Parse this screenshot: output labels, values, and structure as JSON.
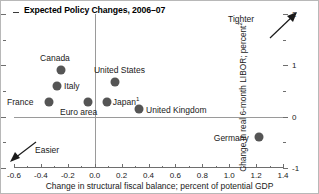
{
  "chart_data": {
    "type": "scatter",
    "title": "Expected Policy Changes, 2006–07",
    "xlabel": "Change in structural fiscal balance; percent of potential GDP",
    "ylabel": "Change in real 6-month LIBOR; percent",
    "ylabel_superscript": "2",
    "xlim": [
      -0.6,
      1.4
    ],
    "ylim": [
      -1,
      2
    ],
    "xticks": [
      -0.6,
      -0.4,
      -0.2,
      0.0,
      0.2,
      0.4,
      0.6,
      0.8,
      1.0,
      1.2,
      1.4
    ],
    "xtick_labels": [
      "-0.6",
      "-0.4",
      "-0.2",
      "0.0",
      "0.2",
      "0.4",
      "0.6",
      "0.8",
      "1.0",
      "1.2",
      "1.4"
    ],
    "yticks": [
      2,
      1,
      0,
      -1
    ],
    "ytick_labels": [
      "2",
      "1",
      "0",
      "-1"
    ],
    "yticks_minor": [
      1.5,
      0.5,
      -0.5
    ],
    "grid": false,
    "legend": "none",
    "zero_line_y": 0,
    "zero_line_x": 0.0,
    "points": [
      {
        "label": "Canada",
        "x": -0.25,
        "y": 0.9,
        "label_dx": -21,
        "label_dy": -17
      },
      {
        "label": "Italy",
        "x": -0.28,
        "y": 0.6,
        "label_dx": 7,
        "label_dy": -5
      },
      {
        "label": "France",
        "x": -0.34,
        "y": 0.29,
        "label_dx": -42,
        "label_dy": -5
      },
      {
        "label": "Euro area",
        "x": -0.05,
        "y": 0.29,
        "label_dx": -28,
        "label_dy": 5
      },
      {
        "label": "Japan",
        "x": 0.09,
        "y": 0.29,
        "label_dx": 6,
        "label_dy": -6,
        "footnote": "1"
      },
      {
        "label": "United States",
        "x": 0.15,
        "y": 0.67,
        "label_dx": -21,
        "label_dy": -17
      },
      {
        "label": "United Kingdom",
        "x": 0.33,
        "y": 0.14,
        "label_dx": 7,
        "label_dy": -4
      },
      {
        "label": "Germany",
        "x": 1.22,
        "y": -0.39,
        "label_dx": -45,
        "label_dy": -4
      }
    ],
    "annotations": [
      {
        "name": "tighter",
        "text": "Tighter",
        "direction": "up-right"
      },
      {
        "name": "easier",
        "text": "Easier",
        "direction": "down-left"
      }
    ],
    "colors": {
      "marker": "#555555",
      "axis": "#6e6e6e",
      "zero_line": "#9a9a9a",
      "text": "#1a1a1a",
      "background": "#ffffff",
      "border": "#b8b8b8"
    }
  }
}
